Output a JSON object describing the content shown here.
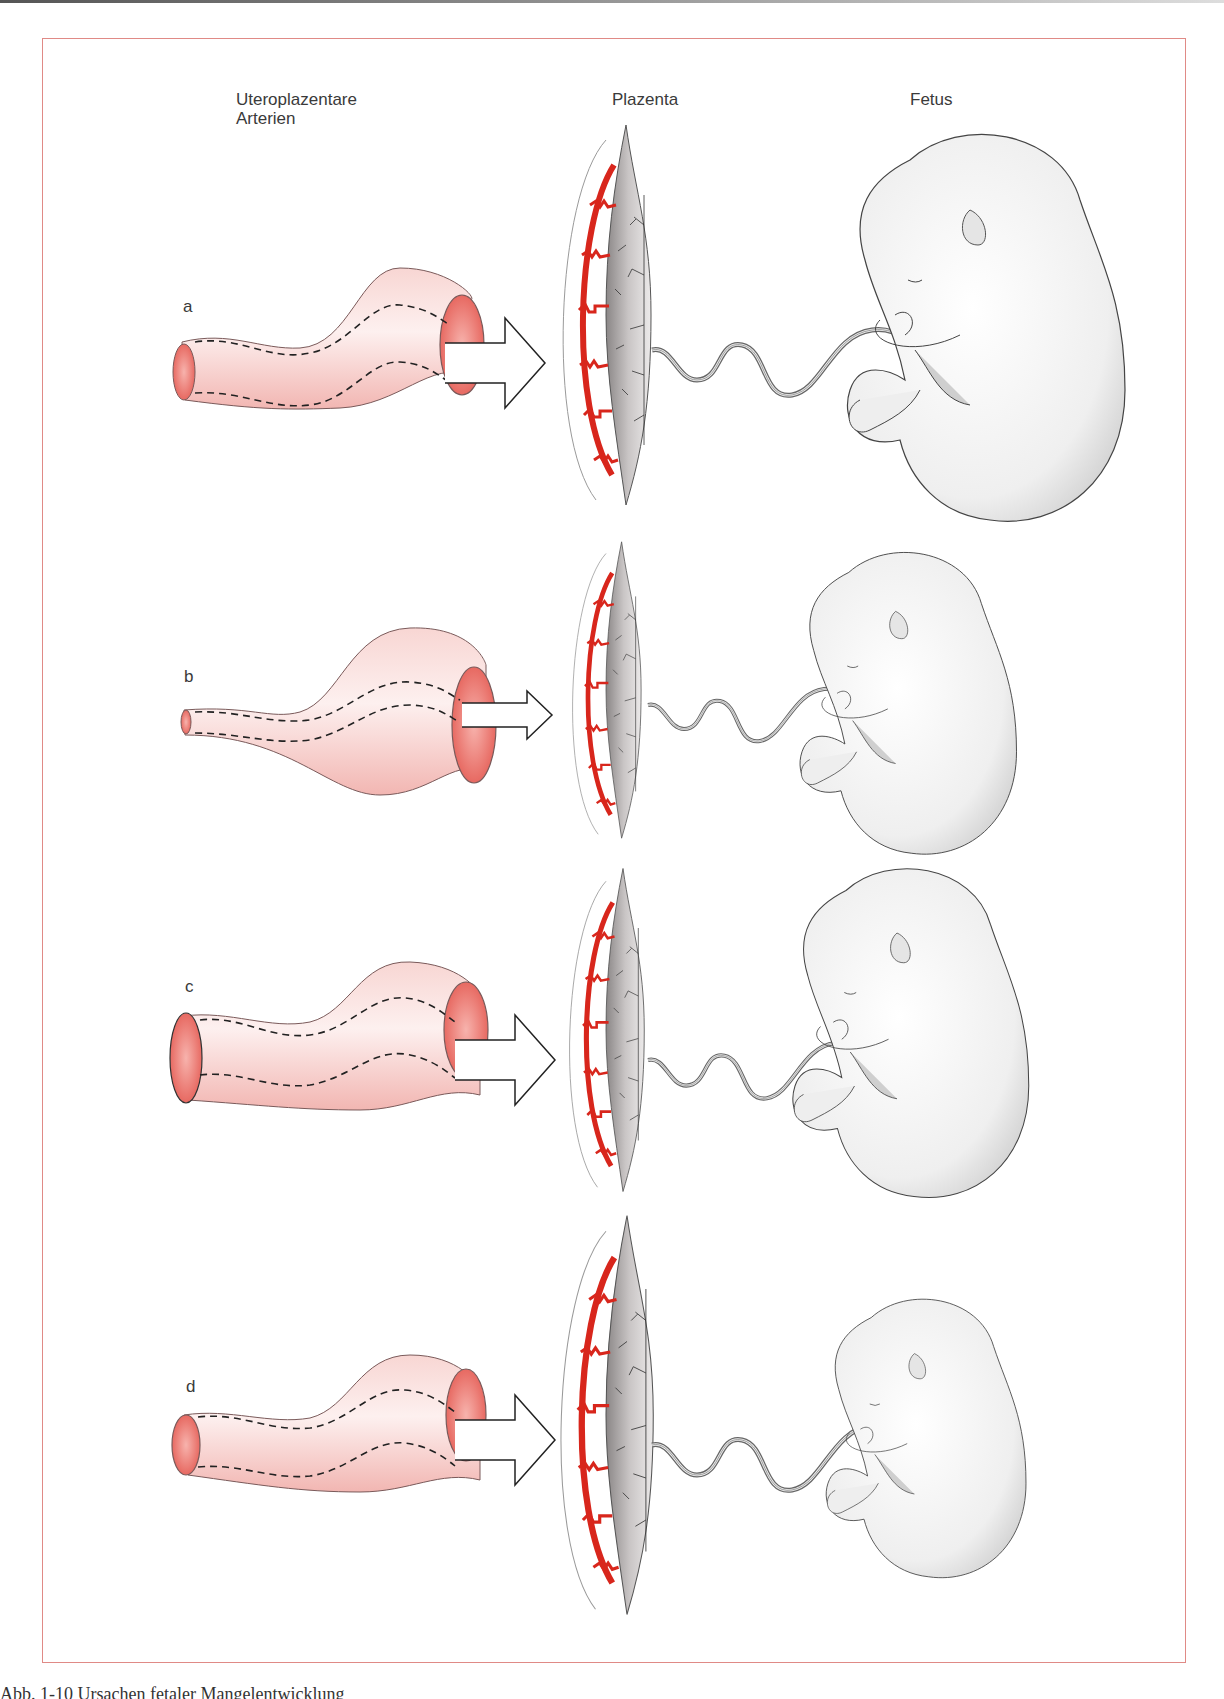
{
  "figure": {
    "column_headers": {
      "arteries": [
        "Uteroplazentare",
        "Arterien"
      ],
      "placenta": "Plazenta",
      "fetus": "Fetus"
    },
    "panels": [
      {
        "label": "a",
        "artery": "wide lumen throughout, large arrow",
        "fetus": "large"
      },
      {
        "label": "b",
        "artery": "narrow proximal lumen, small arrow",
        "fetus": "small"
      },
      {
        "label": "c",
        "artery": "wide lumen, large arrow",
        "fetus": "medium"
      },
      {
        "label": "d",
        "artery": "wide lumen, large arrow",
        "fetus": "small"
      }
    ],
    "caption": "Abb. 1-10   Ursachen fetaler Mangelentwicklung",
    "colors": {
      "frame": "#e08a86",
      "artery_fill": "#f6c9c6",
      "artery_inner": "#e4605a",
      "spiral_artery": "#d8261c",
      "line": "#2a2a2a"
    }
  }
}
